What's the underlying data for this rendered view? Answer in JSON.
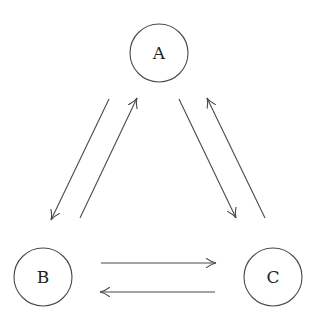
{
  "diagram": {
    "type": "directed-graph",
    "colors": {
      "stroke": "#4a4a4a",
      "text": "#222222",
      "background": "#ffffff"
    },
    "nodes": [
      {
        "id": "A",
        "label": "A",
        "cx": 159,
        "cy": 53,
        "r": 29
      },
      {
        "id": "B",
        "label": "B",
        "cx": 43,
        "cy": 277,
        "r": 29
      },
      {
        "id": "C",
        "label": "C",
        "cx": 273,
        "cy": 277,
        "r": 29
      }
    ],
    "edges": [
      {
        "from": "A",
        "to": "B",
        "x1": 109,
        "y1": 99,
        "x2": 51,
        "y2": 220
      },
      {
        "from": "B",
        "to": "A",
        "x1": 80,
        "y1": 218,
        "x2": 137,
        "y2": 98
      },
      {
        "from": "A",
        "to": "C",
        "x1": 179,
        "y1": 99,
        "x2": 236,
        "y2": 218
      },
      {
        "from": "C",
        "to": "A",
        "x1": 265,
        "y1": 218,
        "x2": 207,
        "y2": 98
      },
      {
        "from": "B",
        "to": "C",
        "x1": 101,
        "y1": 263,
        "x2": 216,
        "y2": 263
      },
      {
        "from": "C",
        "to": "B",
        "x1": 215,
        "y1": 292,
        "x2": 100,
        "y2": 292
      }
    ]
  }
}
